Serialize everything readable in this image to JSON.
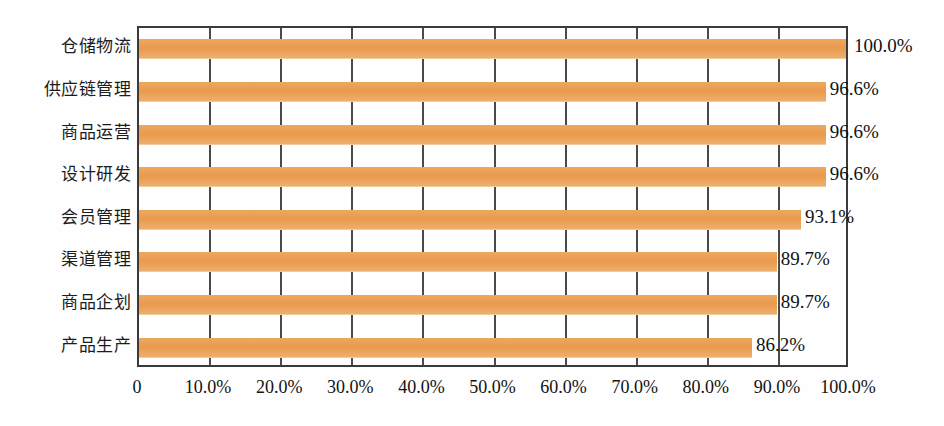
{
  "chart_data": {
    "type": "bar",
    "orientation": "horizontal",
    "title": "",
    "subtitle": "",
    "xlabel": "",
    "ylabel": "",
    "xlim": [
      0,
      100
    ],
    "grid": true,
    "legend": false,
    "legend_position": "none",
    "bar_color": "#e99a4d",
    "axis_color": "#3a3a3a",
    "categories": [
      "仓储物流",
      "供应链管理",
      "商品运营",
      "设计研发",
      "会员管理",
      "渠道管理",
      "商品企划",
      "产品生产"
    ],
    "values": [
      100.0,
      96.6,
      96.6,
      96.6,
      93.1,
      89.7,
      89.7,
      86.2
    ],
    "value_labels": [
      "100.0%",
      "96.6%",
      "96.6%",
      "96.6%",
      "93.1%",
      "89.7%",
      "89.7%",
      "86.2%"
    ],
    "xticks": [
      0,
      10,
      20,
      30,
      40,
      50,
      60,
      70,
      80,
      90,
      100
    ],
    "xtick_labels": [
      "0",
      "10.0%",
      "20.0%",
      "30.0%",
      "40.0%",
      "50.0%",
      "60.0%",
      "70.0%",
      "80.0%",
      "90.0%",
      "100.0%"
    ]
  }
}
